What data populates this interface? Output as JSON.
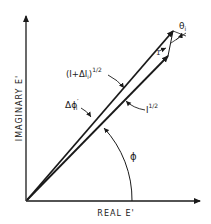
{
  "diagram": {
    "axes": {
      "x_label": "REAL E'",
      "y_label": "IMAGINARY E'"
    },
    "vectors": {
      "outer_label": "(I+ΔI",
      "outer_sub": "i",
      "outer_exp": "1/2",
      "outer_close": ")",
      "inner_label": "I",
      "inner_exp": "1/2"
    },
    "angles": {
      "phi": "ϕ",
      "delta_phi": "Δϕ",
      "delta_phi_prime": "′",
      "delta_phi_sub": "i",
      "theta": "θ",
      "theta_sub": "i",
      "small_vector_label": "1"
    },
    "colors": {
      "ink": "#1a1a1a",
      "background": "#ffffff"
    }
  }
}
